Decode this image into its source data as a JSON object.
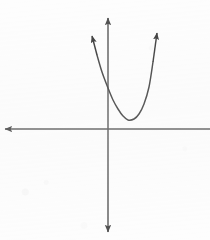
{
  "figure": {
    "background_color": "#fdfdfd",
    "line_color": "#5f5f5f",
    "curve_color": "#4a4a4a",
    "width": 210,
    "height": 240
  },
  "chart_data": {
    "type": "line",
    "title": "",
    "xlabel": "",
    "ylabel": "",
    "grid": false,
    "legend": null,
    "axes": {
      "origin_px": [
        108,
        129
      ],
      "x_axis": {
        "name": "x-axis",
        "y_px": 129,
        "from_px": 5,
        "to_px": 210,
        "left_arrow": true,
        "right_arrow": false,
        "note": "extends off the right edge of the image, cropped"
      },
      "y_axis": {
        "name": "y-axis",
        "x_px": 108,
        "from_px": 18,
        "to_px": 232,
        "up_arrow": true,
        "down_arrow": true
      }
    },
    "series": [
      {
        "name": "parabola",
        "shape": "upward-opening parabola",
        "vertex_px": [
          128,
          120
        ],
        "opens": "up",
        "left_branch_endpoint_px": [
          92,
          36
        ],
        "right_branch_endpoint_px": [
          157,
          33
        ],
        "left_branch_arrow": true,
        "right_branch_arrow": true,
        "y_axis_crossing_px": [
          108,
          88
        ],
        "points_px": [
          [
            92,
            36
          ],
          [
            97,
            55
          ],
          [
            102,
            72
          ],
          [
            108,
            88
          ],
          [
            113,
            100
          ],
          [
            118,
            109
          ],
          [
            123,
            116
          ],
          [
            128,
            120
          ],
          [
            134,
            119
          ],
          [
            139,
            114
          ],
          [
            144,
            104
          ],
          [
            149,
            87
          ],
          [
            153,
            62
          ],
          [
            157,
            33
          ]
        ]
      }
    ]
  }
}
